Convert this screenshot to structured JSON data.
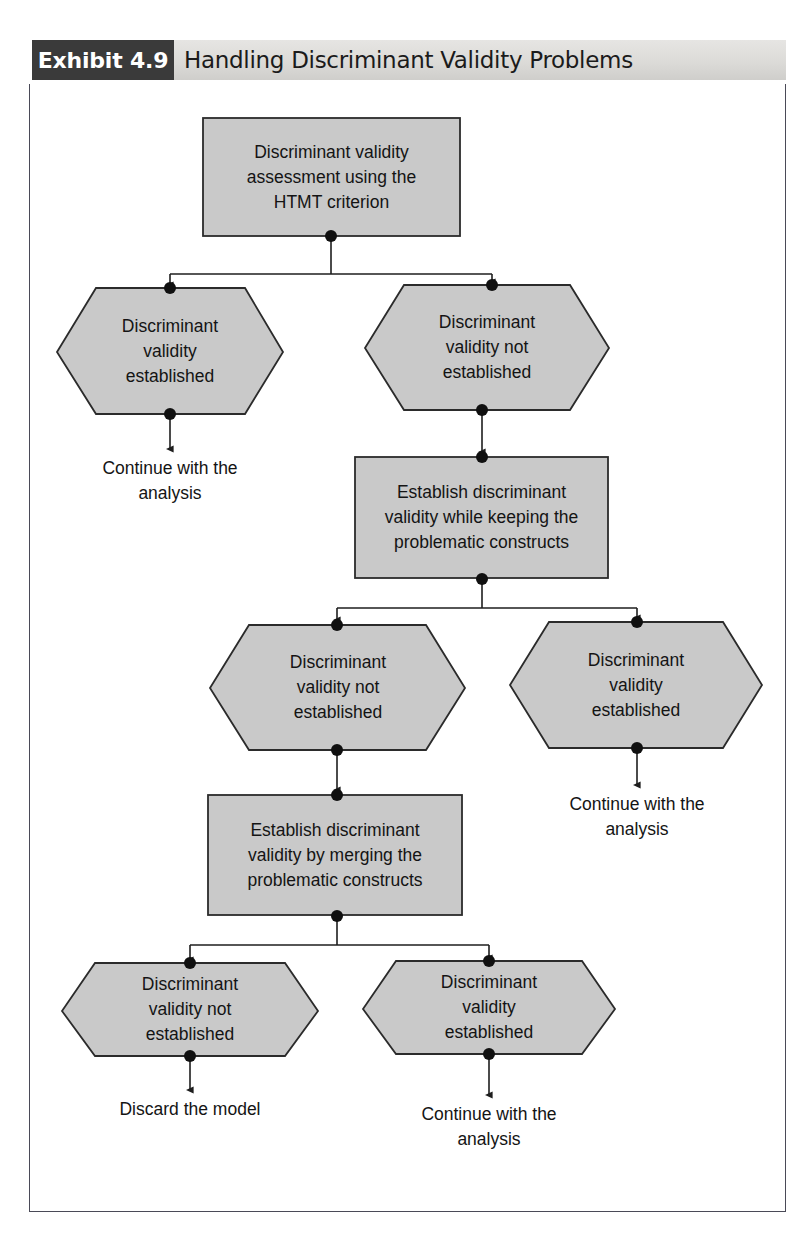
{
  "header": {
    "exhibit_tag": "Exhibit 4.9",
    "title": "Handling Discriminant Validity Problems"
  },
  "colors": {
    "node_fill": "#c9c9c9",
    "node_stroke": "#2b2b2b",
    "connector": "#1e1e1e",
    "tag_background": "#3a3a3a",
    "header_background": "#dcdbd8",
    "frame_border": "#4a4a57",
    "text": "#141414"
  },
  "diagram": {
    "type": "flowchart",
    "nodes": [
      {
        "id": "n1",
        "shape": "rectangle",
        "label": "Discriminant validity\nassessment using the\nHTMT criterion"
      },
      {
        "id": "n2",
        "shape": "hexagon",
        "label": "Discriminant\nvalidity\nestablished"
      },
      {
        "id": "n3",
        "shape": "hexagon",
        "label": "Discriminant\nvalidity not\nestablished"
      },
      {
        "id": "n4",
        "shape": "rectangle",
        "label": "Establish discriminant\nvalidity while keeping the\nproblematic constructs"
      },
      {
        "id": "n5",
        "shape": "hexagon",
        "label": "Discriminant\nvalidity not\nestablished"
      },
      {
        "id": "n6",
        "shape": "hexagon",
        "label": "Discriminant\nvalidity\nestablished"
      },
      {
        "id": "n7",
        "shape": "rectangle",
        "label": "Establish discriminant\nvalidity by merging the\nproblematic constructs"
      },
      {
        "id": "n8",
        "shape": "hexagon",
        "label": "Discriminant\nvalidity not\nestablished"
      },
      {
        "id": "n9",
        "shape": "hexagon",
        "label": "Discriminant\nvalidity\nestablished"
      }
    ],
    "terminals": [
      {
        "id": "t1",
        "label": "Continue with the\nanalysis"
      },
      {
        "id": "t2",
        "label": "Continue with the\nanalysis"
      },
      {
        "id": "t3",
        "label": "Discard the model"
      },
      {
        "id": "t4",
        "label": "Continue with the\nanalysis"
      }
    ],
    "edges": [
      {
        "from": "n1",
        "to": "n2",
        "style": "branch"
      },
      {
        "from": "n1",
        "to": "n3",
        "style": "branch"
      },
      {
        "from": "n2",
        "to": "t1",
        "style": "straight"
      },
      {
        "from": "n3",
        "to": "n4",
        "style": "straight"
      },
      {
        "from": "n4",
        "to": "n5",
        "style": "branch"
      },
      {
        "from": "n4",
        "to": "n6",
        "style": "branch"
      },
      {
        "from": "n6",
        "to": "t2",
        "style": "straight"
      },
      {
        "from": "n5",
        "to": "n7",
        "style": "straight"
      },
      {
        "from": "n7",
        "to": "n8",
        "style": "branch"
      },
      {
        "from": "n7",
        "to": "n9",
        "style": "branch"
      },
      {
        "from": "n8",
        "to": "t3",
        "style": "straight"
      },
      {
        "from": "n9",
        "to": "t4",
        "style": "straight"
      }
    ]
  }
}
